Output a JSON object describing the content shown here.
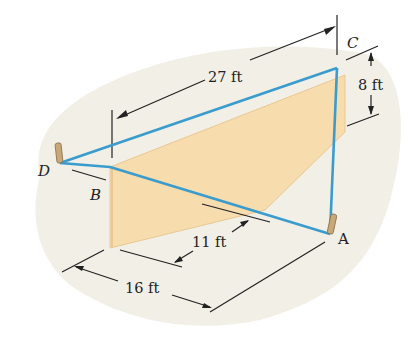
{
  "diagram": {
    "colors": {
      "ground": "#f1efe6",
      "wall": "#f7dcae",
      "wall_edge": "#eac894",
      "cable": "#3a9ccd",
      "dimension_line": "#222222",
      "anchor": "#c9a878"
    },
    "points": {
      "A": "A",
      "B": "B",
      "C": "C",
      "D": "D"
    },
    "dimensions": {
      "top_length": "27 ft",
      "height": "8 ft",
      "bottom_short": "11 ft",
      "bottom_long": "16 ft"
    }
  }
}
